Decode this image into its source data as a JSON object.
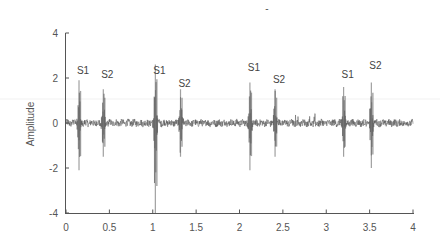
{
  "chart_data": {
    "type": "line",
    "title": "",
    "title_mark": "-",
    "xlabel": "",
    "ylabel": "Amplitude",
    "xlim": [
      0,
      4
    ],
    "ylim": [
      -4,
      4
    ],
    "x_ticks": [
      "0",
      "0.5",
      "1",
      "1.5",
      "2",
      "2.5",
      "3",
      "3.5",
      "4"
    ],
    "y_ticks": [
      "4",
      "2",
      "0",
      "-2",
      "-4"
    ],
    "grid": false,
    "legend": null,
    "series": [
      {
        "name": "Heart sound signal",
        "color": "#555555",
        "baseline_noise_amplitude": 0.15,
        "peaks": [
          {
            "label": "S1",
            "x": 0.15,
            "max": 1.9,
            "min": -2.1
          },
          {
            "label": "S2",
            "x": 0.43,
            "max": 1.5,
            "min": -1.5
          },
          {
            "label": "S1",
            "x": 1.03,
            "max": 2.6,
            "min": -4.0
          },
          {
            "label": "S2",
            "x": 1.32,
            "max": 1.5,
            "min": -1.5
          },
          {
            "label": "S1",
            "x": 2.12,
            "max": 1.8,
            "min": -2.1
          },
          {
            "label": "S2",
            "x": 2.41,
            "max": 1.5,
            "min": -1.5
          },
          {
            "label": "S1",
            "x": 3.2,
            "max": 1.6,
            "min": -1.5
          },
          {
            "label": "S2",
            "x": 3.52,
            "max": 1.8,
            "min": -2.0
          }
        ]
      }
    ],
    "annotations": [
      {
        "text": "S1",
        "x": 0.15,
        "y": 2.2
      },
      {
        "text": "S2",
        "x": 0.43,
        "y": 2.0
      },
      {
        "text": "S1",
        "x": 1.03,
        "y": 2.2
      },
      {
        "text": "S2",
        "x": 1.32,
        "y": 1.6
      },
      {
        "text": "S1",
        "x": 2.12,
        "y": 2.3
      },
      {
        "text": "S2",
        "x": 2.41,
        "y": 1.8
      },
      {
        "text": "S1",
        "x": 3.2,
        "y": 2.0
      },
      {
        "text": "S2",
        "x": 3.52,
        "y": 2.4
      }
    ]
  }
}
